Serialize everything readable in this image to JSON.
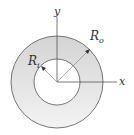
{
  "figure": {
    "type": "annulus-cross-section",
    "labels": {
      "y_axis": "y",
      "x_axis": "x",
      "inner_radius": "R",
      "inner_radius_sub": "i",
      "outer_radius": "R",
      "outer_radius_sub": "o"
    },
    "colors": {
      "fill_top": "#d6d6d6",
      "fill_bottom": "#f2f2f2",
      "stroke": "#555555",
      "inner_fill": "#ffffff"
    }
  }
}
